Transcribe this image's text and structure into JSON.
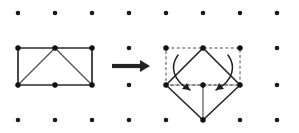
{
  "figure": {
    "canvas": {
      "width": 299,
      "height": 133,
      "background": "#ffffff"
    },
    "colors": {
      "dot": "#1a1a1a",
      "solid_edge": "#2b2b2b",
      "thin_edge": "#444444",
      "ghost_edge": "#4a4a4a",
      "arrow": "#1f1f1f",
      "big_arrow": "#222222"
    },
    "grid": {
      "label": "dot-grid",
      "columns": 8,
      "rows": 4,
      "x_positions": [
        18,
        55,
        92,
        129,
        166,
        203,
        240,
        277
      ],
      "y_positions": [
        13,
        48,
        85,
        120
      ],
      "dot_radius": 2.3
    },
    "left_shape": {
      "label": "source-rectangle",
      "description": "Rectangle with top and bottom midpoints and two diagonals forming triangles",
      "vertices": [
        {
          "name": "top-left",
          "x": 18,
          "y": 48
        },
        {
          "name": "top-mid",
          "x": 55,
          "y": 48
        },
        {
          "name": "top-right",
          "x": 92,
          "y": 48
        },
        {
          "name": "bottom-left",
          "x": 18,
          "y": 85
        },
        {
          "name": "bottom-mid",
          "x": 55,
          "y": 85
        },
        {
          "name": "bottom-right",
          "x": 92,
          "y": 85
        }
      ],
      "outline_path": "M18,48 L92,48 L92,85 L18,85 Z",
      "diagonal_left_path": "M18,85 L55,48",
      "diagonal_right_path": "M55,48 L92,85"
    },
    "transform_arrow": {
      "label": "transform-arrow",
      "direction": "right",
      "shaft_x1": 112,
      "shaft_x2": 141,
      "shaft_y": 66,
      "head_path": "M140,60 L150,66 L140,72 Z"
    },
    "right_shape": {
      "label": "result-diamond",
      "description": "Rotated diamond overlaid on dashed ghost of the original rectangle, with curved rotation arrows",
      "ghost_rect_path": "M166,48 L240,48 L240,85 L166,85 Z",
      "ghost_mid_path": "M166,85 L240,85",
      "diamond_path": "M203,48 L240,85 L203,120 L166,85 Z",
      "inner_vertical_path": "M203,85 L203,120",
      "vertices": [
        {
          "name": "top",
          "x": 203,
          "y": 48
        },
        {
          "name": "left",
          "x": 166,
          "y": 85
        },
        {
          "name": "right",
          "x": 240,
          "y": 85
        },
        {
          "name": "bottom",
          "x": 203,
          "y": 120
        },
        {
          "name": "center",
          "x": 203,
          "y": 85
        },
        {
          "name": "ghost-top-left",
          "x": 166,
          "y": 48
        },
        {
          "name": "ghost-top-right",
          "x": 240,
          "y": 48
        }
      ],
      "rotation_arrow_left": {
        "curve_path": "M178,55 C170,66 172,80 190,90",
        "head_path": "M190,90 L182,89 L187,83 Z"
      },
      "rotation_arrow_right": {
        "curve_path": "M228,55 C236,66 234,80 216,90",
        "head_path": "M216,90 L224,89 L219,83 Z"
      }
    }
  }
}
